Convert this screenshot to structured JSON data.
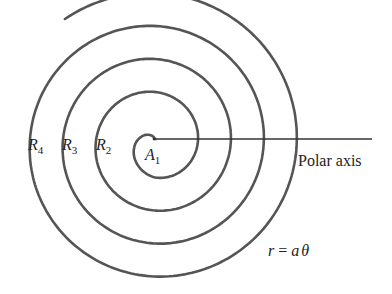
{
  "diagram": {
    "colors": {
      "stroke": "#555555",
      "axis": "#333333",
      "text": "#222222",
      "background": "#ffffff"
    },
    "polar_axis": {
      "label": "Polar axis",
      "origin": [
        154,
        139
      ],
      "end_x": 372
    },
    "spiral": {
      "center": [
        155,
        143
      ],
      "start_angle_deg": 90,
      "growth_px_per_turn": 33,
      "start_radius": 4,
      "turns": 4.1,
      "end_point": [
        283,
        105
      ]
    },
    "labels": {
      "r4": {
        "main": "R",
        "sub": "4"
      },
      "r3": {
        "main": "R",
        "sub": "3"
      },
      "r2": {
        "main": "R",
        "sub": "2"
      },
      "a1": {
        "main": "A",
        "sub": "1"
      },
      "equation": {
        "lhs": "r",
        "eq": " = ",
        "a": "a",
        "theta": "θ"
      }
    }
  }
}
